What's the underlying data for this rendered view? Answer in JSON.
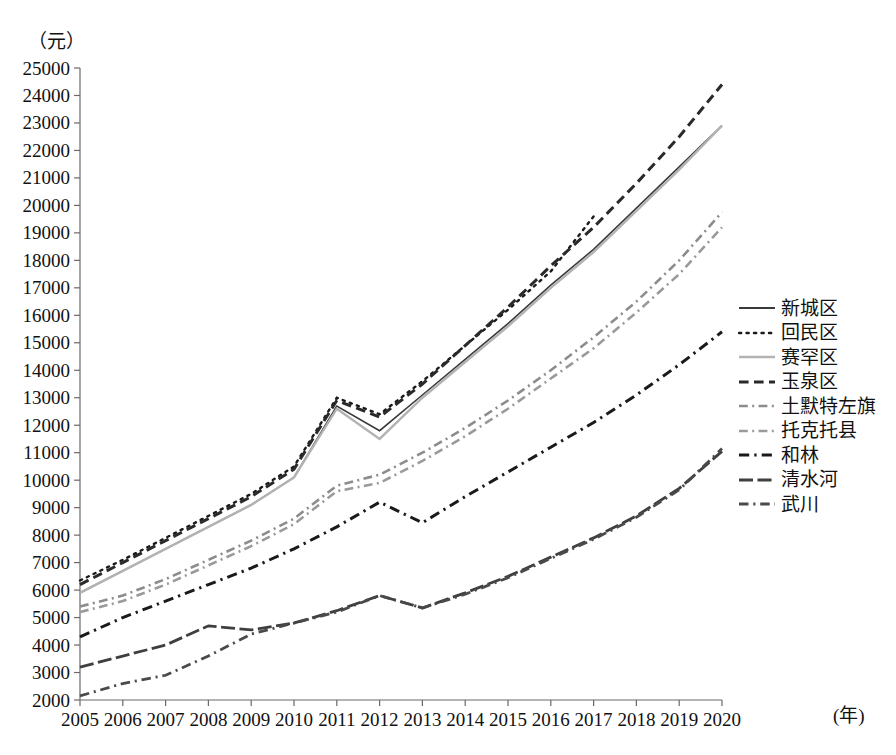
{
  "chart_data": {
    "type": "line",
    "title": "",
    "subtitle": "",
    "xlabel": "(年)",
    "ylabel": "（元）",
    "xlim": [
      2005,
      2020
    ],
    "ylim": [
      2000,
      25000
    ],
    "grid": false,
    "legend_position": "right",
    "x": [
      2005,
      2006,
      2007,
      2008,
      2009,
      2010,
      2011,
      2012,
      2013,
      2014,
      2015,
      2016,
      2017,
      2018,
      2019,
      2020
    ],
    "categories": [
      "2005",
      "2006",
      "2007",
      "2008",
      "2009",
      "2010",
      "2011",
      "2012",
      "2013",
      "2014",
      "2015",
      "2016",
      "2017",
      "2018",
      "2019",
      "2020"
    ],
    "ytick_labels": [
      "2000",
      "3000",
      "4000",
      "5000",
      "6000",
      "7000",
      "8000",
      "9000",
      "10000",
      "11000",
      "12000",
      "13000",
      "14000",
      "15000",
      "16000",
      "17000",
      "18000",
      "19000",
      "20000",
      "21000",
      "22000",
      "23000",
      "24000",
      "25000"
    ],
    "ytick_values": [
      2000,
      3000,
      4000,
      5000,
      6000,
      7000,
      8000,
      9000,
      10000,
      11000,
      12000,
      13000,
      14000,
      15000,
      16000,
      17000,
      18000,
      19000,
      20000,
      21000,
      22000,
      23000,
      24000,
      25000
    ],
    "series": [
      {
        "name": "新城区",
        "color": "#3a3a3a",
        "style": "solid",
        "width": 1.6,
        "values": [
          5900,
          6700,
          7500,
          8300,
          9100,
          10100,
          12700,
          11800,
          13100,
          14400,
          15700,
          17100,
          18400,
          19900,
          21400,
          22900
        ]
      },
      {
        "name": "回民区",
        "color": "#1a1a1a",
        "style": "dotted",
        "width": 2.4,
        "values": [
          6350,
          7100,
          7900,
          8700,
          9500,
          10500,
          13000,
          12400,
          13600,
          14900,
          16200,
          17600,
          19600,
          null,
          null,
          null
        ]
      },
      {
        "name": "赛罕区",
        "color": "#b3b3b3",
        "style": "solid",
        "width": 2.4,
        "values": [
          5900,
          6700,
          7500,
          8300,
          9100,
          10100,
          12600,
          11500,
          13000,
          14300,
          15600,
          17000,
          18300,
          19800,
          21300,
          22900
        ]
      },
      {
        "name": "玉泉区",
        "color": "#2a2a2a",
        "style": "dashed",
        "width": 3.0,
        "values": [
          6200,
          7000,
          7800,
          8600,
          9400,
          10400,
          12900,
          12300,
          13500,
          14900,
          16300,
          17800,
          19200,
          20800,
          22500,
          24400
        ]
      },
      {
        "name": "土默特左旗",
        "color": "#8c8c8c",
        "style": "dashdot",
        "width": 2.6,
        "values": [
          5400,
          5800,
          6400,
          7100,
          7800,
          8600,
          9800,
          10200,
          11000,
          11900,
          12900,
          14000,
          15200,
          16500,
          18000,
          19750
        ]
      },
      {
        "name": "托克托县",
        "color": "#9a9a9a",
        "style": "dashdot",
        "width": 2.6,
        "values": [
          5200,
          5600,
          6200,
          6900,
          7600,
          8400,
          9600,
          9900,
          10700,
          11600,
          12600,
          13700,
          14800,
          16100,
          17500,
          19200
        ]
      },
      {
        "name": "和林",
        "color": "#1a1a1a",
        "style": "dashdot",
        "width": 3.0,
        "values": [
          4300,
          5000,
          5600,
          6200,
          6800,
          7500,
          8300,
          9200,
          8450,
          9400,
          10300,
          11200,
          12100,
          13100,
          14200,
          15400
        ]
      },
      {
        "name": "清水河",
        "color": "#3f3f3f",
        "style": "longdash",
        "width": 2.8,
        "values": [
          3200,
          3600,
          4000,
          4700,
          4550,
          4800,
          5250,
          5800,
          5350,
          5900,
          6500,
          7200,
          7900,
          8700,
          9700,
          11050
        ]
      },
      {
        "name": "武川",
        "color": "#4a4a4a",
        "style": "dashdot",
        "width": 2.8,
        "values": [
          2150,
          2600,
          2900,
          3600,
          4400,
          4800,
          5200,
          5800,
          5350,
          5850,
          6450,
          7150,
          7850,
          8650,
          9650,
          11150
        ]
      }
    ]
  },
  "axes": {
    "y_unit_label": "（元）",
    "x_unit_label": "(年)"
  },
  "legend": {
    "items": [
      {
        "label": "新城区",
        "swatch": "solid-dark-thin"
      },
      {
        "label": "回民区",
        "swatch": "dotted-dark"
      },
      {
        "label": "赛罕区",
        "swatch": "solid-light-gray"
      },
      {
        "label": "玉泉区",
        "swatch": "dashed-dark"
      },
      {
        "label": "土默特左旗",
        "swatch": "solid-mid-gray"
      },
      {
        "label": "托克托县",
        "swatch": "solid-mid-gray"
      },
      {
        "label": "和林",
        "swatch": "dashdot-dark"
      },
      {
        "label": "清水河",
        "swatch": "longdash-dark"
      },
      {
        "label": "武川",
        "swatch": "dashdot-dark"
      }
    ]
  }
}
